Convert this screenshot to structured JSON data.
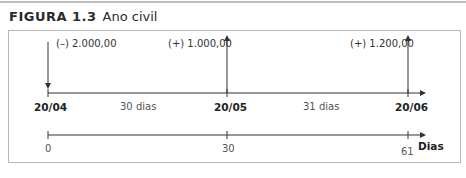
{
  "figure": {
    "number": "FIGURA 1.3",
    "title": "Ano civil"
  },
  "cashflows": [
    {
      "label": "(–) 2.000,00",
      "direction": "down",
      "date": "20/04"
    },
    {
      "label": "(+) 1.000,00",
      "direction": "up",
      "date": "20/05"
    },
    {
      "label": "(+) 1.200,00",
      "direction": "up",
      "date": "20/06"
    }
  ],
  "timeline_dates": {
    "dates": [
      "20/04",
      "20/05",
      "20/06"
    ],
    "intervals": [
      "30 dias",
      "31 dias"
    ]
  },
  "timeline_days": {
    "ticks": [
      "0",
      "30",
      "61"
    ],
    "axis_label": "Dias"
  },
  "colors": {
    "line": "#333333",
    "border": "#b8b8b8",
    "text": "#333333"
  }
}
